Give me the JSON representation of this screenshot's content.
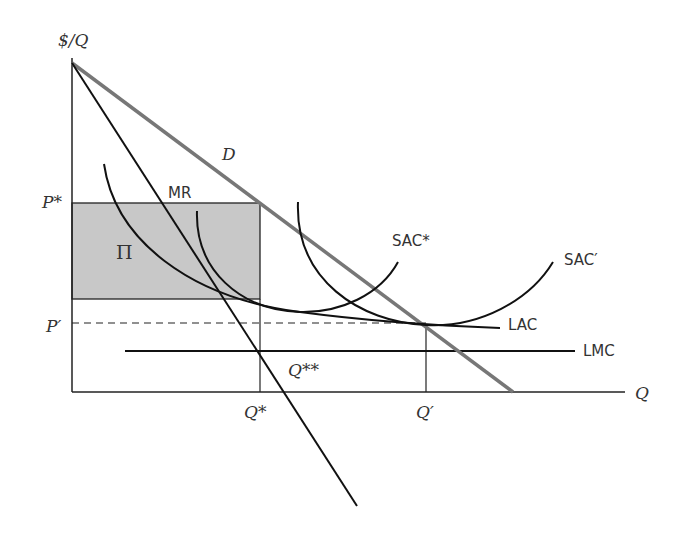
{
  "diagram": {
    "type": "economics-cost-curves",
    "axes": {
      "y_label": "$/Q",
      "x_label": "Q"
    },
    "price_labels": {
      "p_star": "P*",
      "p_prime": "P′"
    },
    "quantity_labels": {
      "q_star": "Q*",
      "q_prime": "Q′",
      "q_double_star": "Q**"
    },
    "curves": {
      "demand": "D",
      "marginal_revenue": "MR",
      "sac_star": "SAC*",
      "sac_prime": "SAC′",
      "lac": "LAC",
      "lmc": "LMC"
    },
    "profit_area": "Π",
    "colors": {
      "demand": "#777777",
      "profit_fill": "#c8c8c8",
      "lines": "#111111"
    }
  }
}
